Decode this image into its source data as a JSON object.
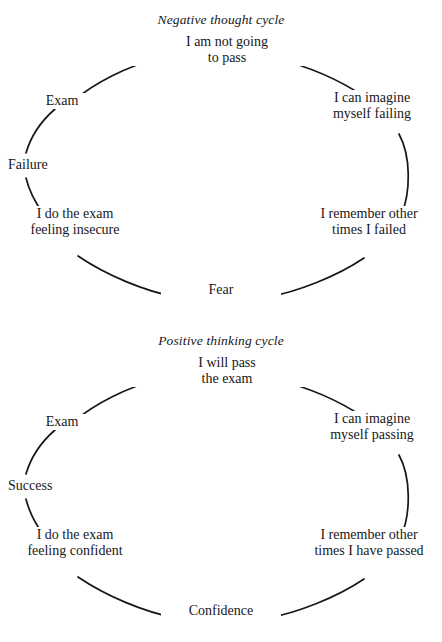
{
  "figure": {
    "type": "cycle-diagram-pair",
    "background_color": "#ffffff",
    "stroke_color": "#17171a",
    "text_color": "#17171a"
  },
  "cycles": [
    {
      "id": "negative",
      "title": "Negative thought cycle",
      "nodes": {
        "top": {
          "line1": "I am not going",
          "line2": "to pass"
        },
        "right_up": {
          "line1": "I can imagine",
          "line2": "myself failing"
        },
        "right_down": {
          "line1": "I remember other",
          "line2": "times I failed"
        },
        "bottom": {
          "line1": "Fear",
          "line2": ""
        },
        "left_down": {
          "line1": "I do the exam",
          "line2": "feeling insecure"
        },
        "left_mid": {
          "line1": "Failure",
          "line2": ""
        },
        "left_up": {
          "line1": "Exam",
          "line2": ""
        }
      }
    },
    {
      "id": "positive",
      "title": "Positive thinking cycle",
      "nodes": {
        "top": {
          "line1": "I will pass",
          "line2": "the exam"
        },
        "right_up": {
          "line1": "I can imagine",
          "line2": "myself passing"
        },
        "right_down": {
          "line1": "I remember other",
          "line2": "times I have passed"
        },
        "bottom": {
          "line1": "Confidence",
          "line2": ""
        },
        "left_down": {
          "line1": "I do the exam",
          "line2": "feeling confident"
        },
        "left_mid": {
          "line1": "Success",
          "line2": ""
        },
        "left_up": {
          "line1": "Exam",
          "line2": ""
        }
      }
    }
  ]
}
